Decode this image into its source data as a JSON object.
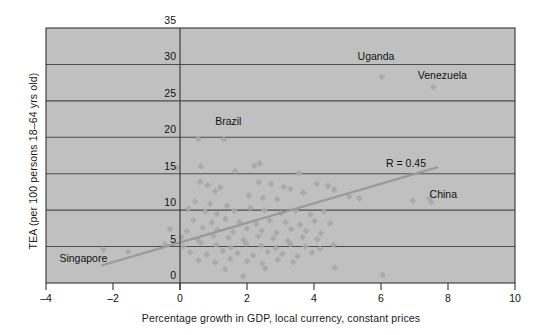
{
  "chart_data": {
    "type": "scatter",
    "title": "",
    "xlabel": "Percentage growth in GDP, local currency, constant prices",
    "ylabel": "TEA (per 100 persons 18–64 yrs old)",
    "xlim": [
      -4,
      10
    ],
    "ylim": [
      0,
      35
    ],
    "xticks": [
      -4,
      -2,
      0,
      2,
      4,
      6,
      8,
      10
    ],
    "xtick_labels": [
      "–4",
      "–2",
      "0",
      "2",
      "4",
      "6",
      "8",
      "10"
    ],
    "yticks": [
      0,
      5,
      10,
      15,
      20,
      25,
      30,
      35
    ],
    "ytick_labels": [
      "0",
      "5",
      "10",
      "15",
      "20",
      "25",
      "30",
      "35"
    ],
    "grid": "horizontal",
    "plot_background": "#c0c0c0",
    "marker": "diamond",
    "marker_color": "#a8a8a8",
    "gridline_color": "#4d4d4d",
    "trendline": {
      "color": "#9a9a9a",
      "label": "R = 0.45",
      "x_start": -2.35,
      "y_start": 2.4,
      "x_end": 7.7,
      "y_end": 15.9
    },
    "annotations": [
      {
        "text": "Uganda",
        "x": 5.3,
        "y": 30.6
      },
      {
        "text": "Venezuela",
        "x": 7.1,
        "y": 28.0
      },
      {
        "text": "Brazil",
        "x": 1.05,
        "y": 21.7
      },
      {
        "text": "R = 0.45",
        "x": 6.15,
        "y": 15.9
      },
      {
        "text": "China",
        "x": 7.45,
        "y": 11.6
      },
      {
        "text": "Singapore",
        "x": -3.6,
        "y": 2.9
      }
    ],
    "points": [
      [
        6.02,
        28.3
      ],
      [
        7.56,
        26.9
      ],
      [
        0.55,
        19.8
      ],
      [
        1.31,
        19.7
      ],
      [
        -0.1,
        15.8
      ],
      [
        0.62,
        16.0
      ],
      [
        1.65,
        15.4
      ],
      [
        2.22,
        16.1
      ],
      [
        2.38,
        16.4
      ],
      [
        3.55,
        15.1
      ],
      [
        0.6,
        13.9
      ],
      [
        0.82,
        13.4
      ],
      [
        1.05,
        12.6
      ],
      [
        1.2,
        13.1
      ],
      [
        2.35,
        13.8
      ],
      [
        2.72,
        13.6
      ],
      [
        3.1,
        13.2
      ],
      [
        3.3,
        12.9
      ],
      [
        3.68,
        12.4
      ],
      [
        4.08,
        13.6
      ],
      [
        4.42,
        13.3
      ],
      [
        4.6,
        12.8
      ],
      [
        2.05,
        12.0
      ],
      [
        2.48,
        11.7
      ],
      [
        2.9,
        11.5
      ],
      [
        0.45,
        11.2
      ],
      [
        0.9,
        10.9
      ],
      [
        1.4,
        10.6
      ],
      [
        5.05,
        11.9
      ],
      [
        5.35,
        11.6
      ],
      [
        6.95,
        11.3
      ],
      [
        7.45,
        11.6
      ],
      [
        7.5,
        11.1
      ],
      [
        0.25,
        10.2
      ],
      [
        0.75,
        9.8
      ],
      [
        1.1,
        9.5
      ],
      [
        1.62,
        9.9
      ],
      [
        2.1,
        10.3
      ],
      [
        2.52,
        10.0
      ],
      [
        3.02,
        9.6
      ],
      [
        3.45,
        9.9
      ],
      [
        3.9,
        9.4
      ],
      [
        4.3,
        9.8
      ],
      [
        0.4,
        8.6
      ],
      [
        0.95,
        8.3
      ],
      [
        1.35,
        8.8
      ],
      [
        1.78,
        8.4
      ],
      [
        2.28,
        8.1
      ],
      [
        2.68,
        8.6
      ],
      [
        3.15,
        8.3
      ],
      [
        3.58,
        8.0
      ],
      [
        4.02,
        8.5
      ],
      [
        4.48,
        8.2
      ],
      [
        -0.3,
        7.4
      ],
      [
        0.2,
        7.1
      ],
      [
        0.68,
        7.6
      ],
      [
        1.12,
        7.3
      ],
      [
        1.58,
        7.0
      ],
      [
        2.0,
        7.5
      ],
      [
        2.44,
        7.2
      ],
      [
        2.88,
        6.9
      ],
      [
        3.32,
        7.4
      ],
      [
        3.76,
        7.1
      ],
      [
        4.2,
        6.8
      ],
      [
        0.05,
        6.3
      ],
      [
        0.52,
        6.0
      ],
      [
        1.0,
        6.5
      ],
      [
        1.45,
        6.2
      ],
      [
        1.9,
        5.9
      ],
      [
        2.34,
        6.4
      ],
      [
        2.78,
        6.1
      ],
      [
        3.22,
        5.8
      ],
      [
        3.66,
        6.3
      ],
      [
        4.1,
        6.0
      ],
      [
        -0.45,
        5.3
      ],
      [
        0.1,
        5.0
      ],
      [
        0.62,
        5.5
      ],
      [
        1.08,
        5.2
      ],
      [
        1.52,
        4.9
      ],
      [
        1.98,
        5.4
      ],
      [
        2.42,
        5.1
      ],
      [
        2.86,
        4.8
      ],
      [
        3.3,
        5.3
      ],
      [
        3.74,
        5.0
      ],
      [
        4.18,
        4.7
      ],
      [
        4.58,
        5.2
      ],
      [
        0.3,
        4.2
      ],
      [
        0.8,
        3.9
      ],
      [
        1.28,
        4.4
      ],
      [
        1.72,
        4.1
      ],
      [
        2.18,
        3.8
      ],
      [
        2.62,
        4.3
      ],
      [
        3.06,
        4.0
      ],
      [
        3.5,
        3.7
      ],
      [
        3.94,
        4.2
      ],
      [
        -2.28,
        4.6
      ],
      [
        -1.55,
        4.3
      ],
      [
        0.55,
        3.1
      ],
      [
        1.05,
        2.8
      ],
      [
        1.5,
        3.3
      ],
      [
        2.0,
        3.0
      ],
      [
        2.46,
        2.7
      ],
      [
        2.92,
        3.2
      ],
      [
        3.38,
        2.9
      ],
      [
        1.35,
        1.9
      ],
      [
        2.55,
        2.0
      ],
      [
        4.62,
        2.1
      ],
      [
        6.05,
        1.1
      ],
      [
        1.88,
        0.9
      ]
    ]
  }
}
